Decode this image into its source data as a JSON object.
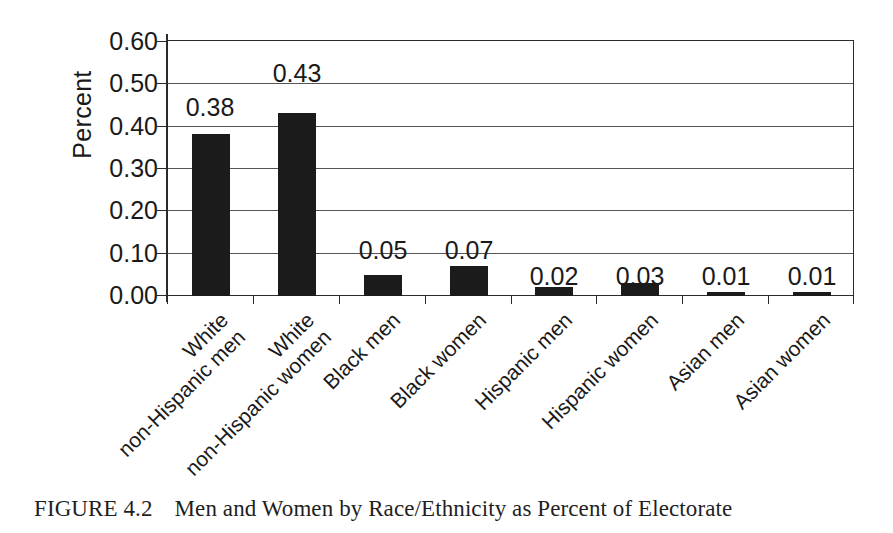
{
  "figure": {
    "caption_label": "FIGURE 4.2",
    "caption_text": "Men and Women by Race/Ethnicity as Percent of Electorate"
  },
  "chart_data": {
    "type": "bar",
    "title": "",
    "subtitle": "",
    "xlabel": "",
    "ylabel": "Percent",
    "ylim": [
      0.0,
      0.6
    ],
    "ytick_values": [
      0.6,
      0.5,
      0.4,
      0.3,
      0.2,
      0.1,
      0.0
    ],
    "ytick_labels": [
      "0.60",
      "0.50",
      "0.40",
      "0.30",
      "0.20",
      "0.10",
      "0.00"
    ],
    "grid": true,
    "legend": false,
    "legend_position": "none",
    "bar_color": "#1b1b1b",
    "categories": [
      "White non-Hispanic men",
      "White non-Hispanic women",
      "Black men",
      "Black women",
      "Hispanic men",
      "Hispanic women",
      "Asian men",
      "Asian women"
    ],
    "category_label_lines": [
      [
        "White",
        "non-Hispanic men"
      ],
      [
        "White",
        "non-Hispanic women"
      ],
      [
        "Black men",
        ""
      ],
      [
        "Black women",
        ""
      ],
      [
        "Hispanic men",
        ""
      ],
      [
        "Hispanic women",
        ""
      ],
      [
        "Asian men",
        ""
      ],
      [
        "Asian women",
        ""
      ]
    ],
    "values": [
      0.38,
      0.43,
      0.05,
      0.07,
      0.02,
      0.03,
      0.01,
      0.01
    ],
    "data_labels": [
      "0.38",
      "0.43",
      "0.05",
      "0.07",
      "0.02",
      "0.03",
      "0.01",
      "0.01"
    ],
    "data_label_y_positions": [
      0.47,
      0.55,
      0.135,
      0.135,
      0.075,
      0.075,
      0.075,
      0.075
    ]
  }
}
